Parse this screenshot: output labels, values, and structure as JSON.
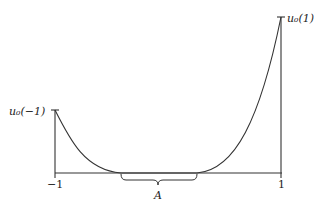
{
  "diagram": {
    "labels": {
      "left_value": "u₀(−1)",
      "right_value": "u₀(1)",
      "x_left": "−1",
      "x_right": "1",
      "interval": "A"
    },
    "colors": {
      "stroke": "#333333",
      "background": "#ffffff"
    }
  }
}
